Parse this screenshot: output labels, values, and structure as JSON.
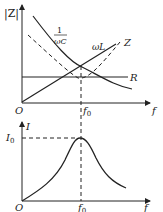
{
  "top_plot": {
    "y_axis_label": "|Z|",
    "x_axis_label": "f",
    "origin_label": "O",
    "marker_label": "f",
    "marker_subscript": "0",
    "curves": {
      "capacitive": {
        "label_num": "1",
        "label_den": "ωC"
      },
      "inductive": {
        "label": "ωL"
      },
      "impedance": {
        "label": "Z"
      },
      "resistance": {
        "label": "R"
      }
    }
  },
  "bottom_plot": {
    "y_axis_label": "I",
    "x_axis_label": "f",
    "origin_label": "O",
    "peak_label": "I",
    "peak_subscript": "0",
    "marker_label": "f",
    "marker_subscript": "0"
  },
  "colors": {
    "stroke": "#222222",
    "background": "#ffffff"
  }
}
